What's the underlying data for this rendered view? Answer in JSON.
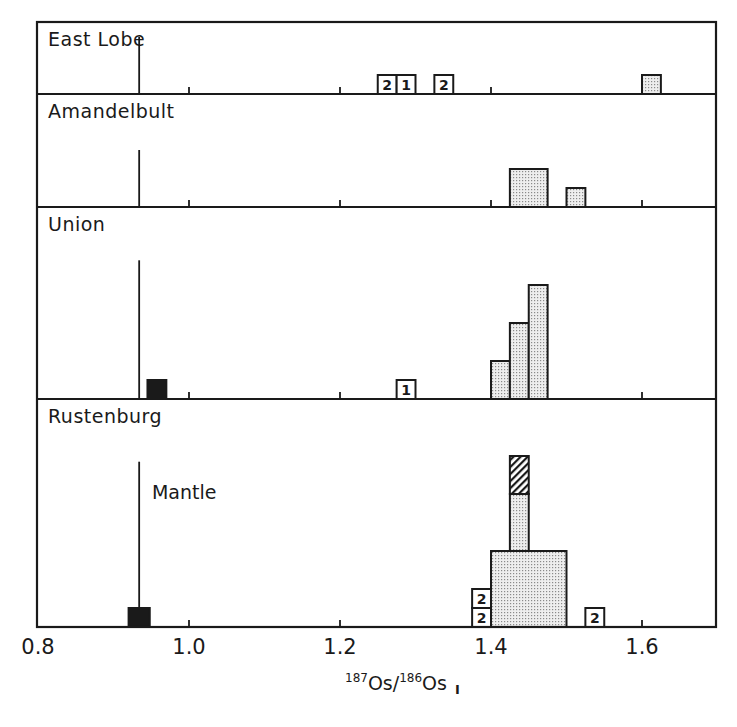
{
  "chart_data": {
    "type": "bar",
    "subtype": "stacked-panel histogram",
    "title": "",
    "xlabel": "187Os/186Os I",
    "xlabel_parts": {
      "sup1": "187",
      "base1": "Os/",
      "sup2": "186",
      "base2": "Os",
      "sub": "I"
    },
    "ylabel": "",
    "xlim": [
      0.8,
      1.7
    ],
    "x_ticks": [
      0.8,
      1.0,
      1.2,
      1.4,
      1.6
    ],
    "x_tick_labels": [
      "0.8",
      "1.0",
      "1.2",
      "1.4",
      "1.6"
    ],
    "minor_ticks_in_panels": [
      1.0,
      1.2,
      1.4,
      1.6
    ],
    "grid": false,
    "bin_width": 0.025,
    "count_unit_px": 19,
    "mantle_value": 0.934,
    "annotations": [
      {
        "text": "Mantle",
        "panel": "Rustenburg",
        "x": 0.935
      }
    ],
    "legend": {
      "stippled": "histogram count",
      "black": "mantle-like sample",
      "hatched": "stacked sample",
      "open_numbered": "sample with number label"
    },
    "panels": [
      {
        "name": "East Lobe",
        "mantle_line_top_count": 3,
        "bars": [
          {
            "x0": 1.25,
            "x1": 1.275,
            "y0": 0,
            "y1": 1,
            "style": "open",
            "label": "2"
          },
          {
            "x0": 1.275,
            "x1": 1.3,
            "y0": 0,
            "y1": 1,
            "style": "open",
            "label": "1"
          },
          {
            "x0": 1.325,
            "x1": 1.35,
            "y0": 0,
            "y1": 1,
            "style": "open",
            "label": "2"
          },
          {
            "x0": 1.6,
            "x1": 1.625,
            "y0": 0,
            "y1": 1,
            "style": "stippled",
            "label": ""
          }
        ]
      },
      {
        "name": "Amandelbult",
        "mantle_line_top_count": 3,
        "bars": [
          {
            "x0": 1.425,
            "x1": 1.475,
            "y0": 0,
            "y1": 2,
            "style": "stippled",
            "label": ""
          },
          {
            "x0": 1.5,
            "x1": 1.525,
            "y0": 0,
            "y1": 1,
            "style": "stippled",
            "label": ""
          }
        ]
      },
      {
        "name": "Union",
        "mantle_line_top_count": 7.3,
        "bars": [
          {
            "x0": 0.945,
            "x1": 0.97,
            "y0": 0,
            "y1": 1,
            "style": "black",
            "label": ""
          },
          {
            "x0": 1.275,
            "x1": 1.3,
            "y0": 0,
            "y1": 1,
            "style": "open",
            "label": "1"
          },
          {
            "x0": 1.4,
            "x1": 1.425,
            "y0": 0,
            "y1": 2,
            "style": "stippled",
            "label": ""
          },
          {
            "x0": 1.425,
            "x1": 1.45,
            "y0": 0,
            "y1": 4,
            "style": "stippled",
            "label": ""
          },
          {
            "x0": 1.45,
            "x1": 1.475,
            "y0": 0,
            "y1": 6,
            "style": "stippled",
            "label": ""
          }
        ]
      },
      {
        "name": "Rustenburg",
        "mantle_line_top_count": 8.7,
        "bars": [
          {
            "x0": 0.92,
            "x1": 0.948,
            "y0": 0,
            "y1": 1,
            "style": "black",
            "label": ""
          },
          {
            "x0": 1.375,
            "x1": 1.4,
            "y0": 0,
            "y1": 1,
            "style": "open",
            "label": "2"
          },
          {
            "x0": 1.375,
            "x1": 1.4,
            "y0": 1,
            "y1": 2,
            "style": "open",
            "label": "2"
          },
          {
            "x0": 1.4,
            "x1": 1.5,
            "y0": 0,
            "y1": 4,
            "style": "stippled",
            "label": ""
          },
          {
            "x0": 1.425,
            "x1": 1.45,
            "y0": 4,
            "y1": 7,
            "style": "stippled",
            "label": ""
          },
          {
            "x0": 1.425,
            "x1": 1.45,
            "y0": 7,
            "y1": 9,
            "style": "hatched",
            "label": ""
          },
          {
            "x0": 1.525,
            "x1": 1.55,
            "y0": 0,
            "y1": 1,
            "style": "open",
            "label": "2"
          }
        ]
      }
    ]
  },
  "layout": {
    "frame": {
      "left": 37,
      "right": 716,
      "top": 22
    },
    "panel_bounds": [
      {
        "top": 22,
        "bottom": 94
      },
      {
        "top": 94,
        "bottom": 207
      },
      {
        "top": 207,
        "bottom": 399
      },
      {
        "top": 399,
        "bottom": 627
      }
    ],
    "x_px_at_0_8": 38,
    "px_per_unit": 755
  },
  "colors": {
    "ink": "#1a1a1a",
    "stipple_bg": "#ececec",
    "stipple_dot": "#8a8a8a",
    "black_fill": "#1a1a1a",
    "background": "#ffffff"
  }
}
